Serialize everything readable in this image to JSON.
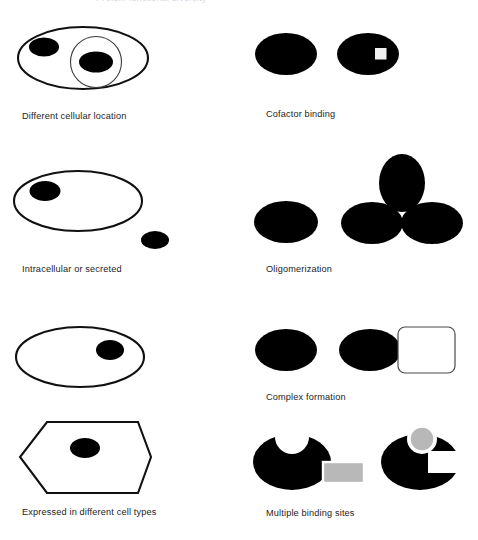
{
  "figure": {
    "title_cropped": "Protein functional diversity",
    "background_color": "#ffffff",
    "ink_color": "#000000",
    "ligand_gray": "#b3b3b3",
    "outline_color": "#111111",
    "width": 478,
    "height": 540
  },
  "panels": [
    {
      "id": "different-cellular-location",
      "caption": "Different cellular location",
      "column": "left",
      "row": 1,
      "elements": [
        "cell-outline-ellipse",
        "nucleus-circle",
        "protein-ellipse-cytoplasm",
        "protein-ellipse-nucleus"
      ]
    },
    {
      "id": "cofactor-binding",
      "caption": "Cofactor binding",
      "column": "right",
      "row": 1,
      "elements": [
        "protein-ellipse-apo",
        "protein-ellipse-holo",
        "cofactor-square"
      ]
    },
    {
      "id": "intracellular-or-secreted",
      "caption": "Intracellular or secreted",
      "column": "left",
      "row": 2,
      "elements": [
        "cell-outline-ellipse",
        "protein-ellipse-intracellular",
        "protein-ellipse-secreted"
      ]
    },
    {
      "id": "oligomerization",
      "caption": "Oligomerization",
      "column": "right",
      "row": 2,
      "elements": [
        "monomer-ellipse",
        "oligomer-top-ellipse",
        "oligomer-left-ellipse",
        "oligomer-right-ellipse"
      ]
    },
    {
      "id": "complex-formation",
      "caption": "Complex formation",
      "column": "right",
      "row": 3,
      "elements": [
        "protein-ellipse-free",
        "protein-ellipse-bound",
        "partner-rounded-rectangle"
      ]
    },
    {
      "id": "expressed-in-different-cell-types",
      "caption": "Expressed in different cell types",
      "column": "left",
      "row": 3,
      "elements": [
        "cell-outline-ellipse",
        "protein-ellipse-in-round-cell",
        "cell-outline-hexagon",
        "protein-ellipse-in-hexagon-cell"
      ]
    },
    {
      "id": "multiple-binding-sites",
      "caption": "Multiple binding sites",
      "column": "right",
      "row": 4,
      "elements": [
        "protein-blob-notched-top",
        "ligand-rectangle",
        "protein-blob-notched-right",
        "ligand-circle"
      ]
    }
  ]
}
